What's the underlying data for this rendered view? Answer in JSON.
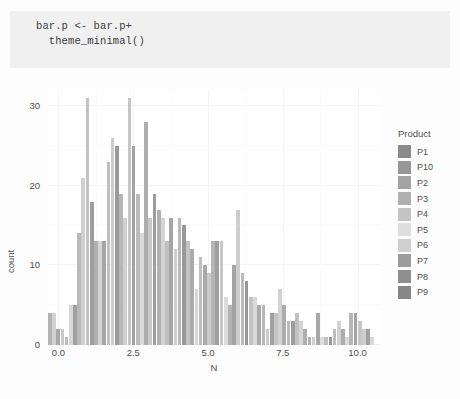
{
  "code_chunk": {
    "lines": [
      "bar.p <- bar.p+",
      "  theme_minimal()"
    ],
    "background": "#f0f0f0"
  },
  "chart_data": {
    "type": "bar",
    "title": "",
    "xlabel": "N",
    "ylabel": "count",
    "xlim": [
      -0.35,
      10.75
    ],
    "ylim": [
      0,
      32
    ],
    "xticks": [
      "0.0",
      "2.5",
      "5.0",
      "7.5",
      "10.0"
    ],
    "xtick_values": [
      0.0,
      2.5,
      5.0,
      7.5,
      10.0
    ],
    "yticks": [
      "0",
      "10",
      "20",
      "30"
    ],
    "ytick_values": [
      0,
      10,
      20,
      30
    ],
    "grid": true,
    "legend_position": "right",
    "legend_title": "Product",
    "legend_entries": [
      "P1",
      "P10",
      "P2",
      "P3",
      "P4",
      "P5",
      "P6",
      "P7",
      "P8",
      "P9"
    ],
    "legend_colors": [
      "#8a8a8a",
      "#969696",
      "#a3a3a3",
      "#b0b0b0",
      "#c4c4c4",
      "#dedede",
      "#cfcfcf",
      "#9c9c9c",
      "#8f8f8f",
      "#878787"
    ],
    "x": [
      -0.28,
      -0.14,
      0.0,
      0.14,
      0.28,
      0.42,
      0.56,
      0.7,
      0.84,
      0.98,
      1.12,
      1.26,
      1.4,
      1.54,
      1.68,
      1.82,
      1.96,
      2.1,
      2.24,
      2.38,
      2.52,
      2.66,
      2.8,
      2.94,
      3.08,
      3.22,
      3.36,
      3.5,
      3.64,
      3.78,
      3.92,
      4.06,
      4.2,
      4.34,
      4.48,
      4.62,
      4.76,
      4.9,
      5.04,
      5.18,
      5.32,
      5.46,
      5.6,
      5.74,
      5.88,
      6.02,
      6.16,
      6.3,
      6.44,
      6.58,
      6.72,
      6.86,
      7.0,
      7.14,
      7.28,
      7.42,
      7.56,
      7.7,
      7.84,
      7.98,
      8.12,
      8.26,
      8.4,
      8.54,
      8.68,
      8.82,
      8.96,
      9.1,
      9.24,
      9.38,
      9.52,
      9.66,
      9.8,
      9.94,
      10.08,
      10.22,
      10.36,
      10.5
    ],
    "values": [
      4,
      4,
      2,
      2,
      1,
      5,
      5,
      14,
      21,
      31,
      18,
      13,
      13,
      13,
      23,
      26,
      25,
      19,
      16,
      31,
      25,
      19,
      14,
      28,
      16,
      19,
      17,
      16,
      13,
      16,
      12,
      16,
      15,
      13,
      12,
      7,
      11,
      10,
      9,
      13,
      13,
      13,
      6,
      5,
      10,
      17,
      9,
      8,
      6,
      6,
      5,
      5,
      2,
      4,
      4,
      7,
      5,
      3,
      3,
      4,
      3,
      2,
      1,
      1,
      4,
      1,
      1,
      1,
      2,
      3,
      2,
      1,
      4,
      4,
      3,
      2,
      2,
      1
    ],
    "bar_colors": [
      "#b4b4b4",
      "#d2d2d2",
      "#a8a8a8",
      "#c9c9c9",
      "#bdbdbd",
      "#d8d8d8",
      "#a0a0a0",
      "#b8b8b8",
      "#cfcfcf",
      "#c2c2c2",
      "#9e9e9e",
      "#b0b0b0",
      "#d5d5d5",
      "#a5a5a5",
      "#bfbfbf",
      "#cccccc",
      "#9a9a9a",
      "#b6b6b6",
      "#d0d0d0",
      "#c6c6c6",
      "#a2a2a2",
      "#bbbbbb",
      "#dadada",
      "#aeaeae",
      "#c8c8c8",
      "#9c9c9c",
      "#b2b2b2",
      "#d4d4d4",
      "#c0c0c0",
      "#a6a6a6",
      "#cecece",
      "#b9b9b9",
      "#989898",
      "#c4c4c4",
      "#ababab",
      "#d7d7d7",
      "#bebebe",
      "#a9a9a9",
      "#cbcbcb",
      "#b5b5b5",
      "#9f9f9f",
      "#c7c7c7",
      "#dcdcdc",
      "#b3b3b3",
      "#a4a4a4",
      "#cdcdcd",
      "#bcbcbc",
      "#969696",
      "#c3c3c3",
      "#d9d9d9",
      "#aaaaaa",
      "#b7b7b7",
      "#cacaca",
      "#a1a1a1",
      "#c5c5c5",
      "#d3d3d3",
      "#acacac",
      "#bababa",
      "#9d9d9d",
      "#c1c1c1",
      "#d6d6d6",
      "#afafaf",
      "#b1b1b1",
      "#cfcfcf",
      "#a7a7a7",
      "#ddddde",
      "#c2c2c2",
      "#999999",
      "#bdbdbd",
      "#d1d1d1",
      "#adadad",
      "#dbdbdb",
      "#b6b6b6",
      "#a3a3a3",
      "#c6c6c6",
      "#cecece",
      "#a0a0a0",
      "#d8d8d8"
    ]
  }
}
